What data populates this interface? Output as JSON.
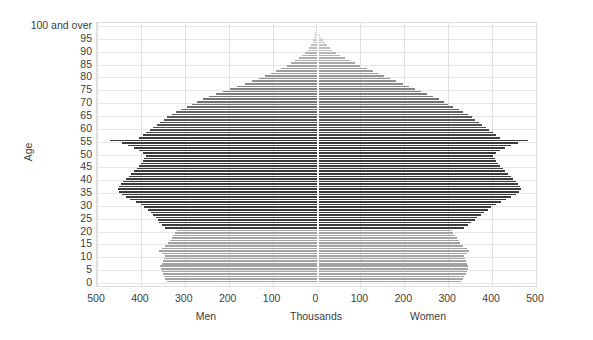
{
  "chart_data": {
    "type": "bar",
    "subtype": "population-pyramid",
    "title": "",
    "xlabel": "Thousands",
    "ylabel": "Age",
    "left_series_label": "Men",
    "right_series_label": "Women",
    "grid": true,
    "legend_position": "none",
    "xlim": [
      -500,
      500
    ],
    "ylim": [
      0,
      100
    ],
    "x_tick_labels": [
      "500",
      "400",
      "300",
      "200",
      "100",
      "0",
      "100",
      "200",
      "300",
      "400",
      "500"
    ],
    "x_tick_values": [
      -500,
      -400,
      -300,
      -200,
      -100,
      0,
      100,
      200,
      300,
      400,
      500
    ],
    "y_tick_labels": [
      "0",
      "5",
      "10",
      "15",
      "20",
      "25",
      "30",
      "35",
      "40",
      "45",
      "50",
      "55",
      "60",
      "65",
      "70",
      "75",
      "80",
      "85",
      "90",
      "95",
      "100 and over"
    ],
    "y_tick_values": [
      0,
      5,
      10,
      15,
      20,
      25,
      30,
      35,
      40,
      45,
      50,
      55,
      60,
      65,
      70,
      75,
      80,
      85,
      90,
      95,
      100
    ],
    "ages": [
      0,
      1,
      2,
      3,
      4,
      5,
      6,
      7,
      8,
      9,
      10,
      11,
      12,
      13,
      14,
      15,
      16,
      17,
      18,
      19,
      20,
      21,
      22,
      23,
      24,
      25,
      26,
      27,
      28,
      29,
      30,
      31,
      32,
      33,
      34,
      35,
      36,
      37,
      38,
      39,
      40,
      41,
      42,
      43,
      44,
      45,
      46,
      47,
      48,
      49,
      50,
      51,
      52,
      53,
      54,
      55,
      56,
      57,
      58,
      59,
      60,
      61,
      62,
      63,
      64,
      65,
      66,
      67,
      68,
      69,
      70,
      71,
      72,
      73,
      74,
      75,
      76,
      77,
      78,
      79,
      80,
      81,
      82,
      83,
      84,
      85,
      86,
      87,
      88,
      89,
      90,
      91,
      92,
      93,
      94,
      95,
      96,
      97,
      98,
      99,
      100
    ],
    "series": [
      {
        "name": "Men",
        "side": "left",
        "units": "thousands",
        "values": [
          340,
          344,
          347,
          350,
          352,
          354,
          356,
          352,
          350,
          348,
          345,
          352,
          358,
          352,
          344,
          338,
          334,
          330,
          326,
          322,
          318,
          346,
          352,
          358,
          362,
          366,
          372,
          378,
          384,
          392,
          400,
          412,
          424,
          434,
          442,
          450,
          452,
          450,
          446,
          440,
          434,
          428,
          422,
          416,
          410,
          404,
          400,
          396,
          392,
          388,
          396,
          404,
          416,
          430,
          444,
          470,
          404,
          396,
          388,
          380,
          372,
          364,
          356,
          348,
          340,
          330,
          320,
          308,
          296,
          284,
          272,
          258,
          244,
          228,
          212,
          196,
          180,
          164,
          148,
          132,
          118,
          104,
          92,
          80,
          68,
          58,
          48,
          40,
          32,
          26,
          20,
          16,
          12,
          9,
          7,
          5,
          4,
          3,
          2,
          1,
          2
        ]
      },
      {
        "name": "Women",
        "side": "right",
        "units": "thousands",
        "values": [
          330,
          334,
          337,
          340,
          342,
          344,
          346,
          342,
          340,
          338,
          335,
          342,
          348,
          342,
          334,
          328,
          324,
          320,
          316,
          312,
          308,
          336,
          344,
          352,
          360,
          366,
          374,
          382,
          390,
          398,
          408,
          420,
          432,
          444,
          454,
          462,
          466,
          464,
          460,
          454,
          448,
          442,
          436,
          430,
          424,
          418,
          414,
          410,
          406,
          402,
          410,
          418,
          430,
          444,
          458,
          482,
          418,
          410,
          402,
          394,
          386,
          378,
          370,
          362,
          354,
          344,
          334,
          324,
          312,
          300,
          290,
          278,
          266,
          252,
          238,
          224,
          210,
          196,
          182,
          168,
          154,
          140,
          128,
          114,
          100,
          88,
          76,
          64,
          54,
          44,
          36,
          30,
          24,
          19,
          15,
          11,
          8,
          6,
          4,
          3,
          5
        ]
      }
    ],
    "color_notes": {
      "dark_bar": "#3a3a3a",
      "light_bar": "#a0a0a0",
      "pale_bar": "#cfcfcf",
      "gridline": "#e6e6e6",
      "zero_axis_line": "#ffffff",
      "plot_border": "#dedede",
      "text": "#3c3c3c"
    },
    "shading_rule": {
      "description": "Bars are shaded by age band; ages 21-55 are darkest, below 21 are mid grey, above 55 fade progressively lighter with age.",
      "dark_band_ages": [
        21,
        55
      ],
      "mid_band_ages": [
        0,
        20
      ],
      "fade_band_ages": [
        56,
        100
      ]
    },
    "annotations": []
  }
}
